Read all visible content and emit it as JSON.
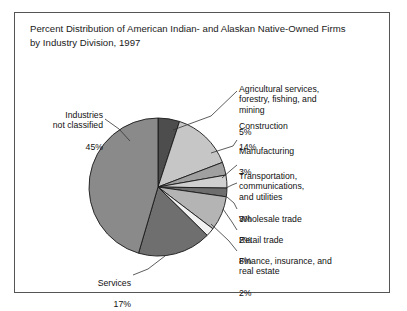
{
  "figure": {
    "title": "Percent Distribution of American Indian- and Alaskan Native-Owned Firms\nby Industry Division, 1997",
    "border_color": "#555555",
    "background_color": "#ffffff"
  },
  "chart_data": {
    "type": "pie",
    "title": "Percent Distribution of American Indian- and Alaskan Native-Owned Firms by Industry Division, 1997",
    "xlabel": "",
    "ylabel": "",
    "units": "percent",
    "start_angle_deg": 0,
    "direction": "clockwise",
    "legend": "none (direct labels with leader lines)",
    "grid": false,
    "categories": [
      "Agricultural services, forestry, fishing, and mining",
      "Construction",
      "Manufacturing",
      "Transportation, communications, and utilities",
      "Wholesale trade",
      "Retail trade",
      "Finance, insurance, and real estate",
      "Services",
      "Industries not classified"
    ],
    "values": [
      5,
      14,
      3,
      3,
      2,
      8,
      2,
      17,
      45
    ],
    "value_labels": [
      "5%",
      "14%",
      "3%",
      "3%",
      "2%",
      "8%",
      "2%",
      "17%",
      "45%"
    ],
    "colors": [
      "#4d4d4d",
      "#c6c6c6",
      "#a0a0a0",
      "#d0d0d0",
      "#6e6e6e",
      "#b4b4b4",
      "#f2f2f2",
      "#6f6f6f",
      "#8a8a8a"
    ],
    "slice_edge_color": "#1a1a1a",
    "total": 99
  },
  "labels": {
    "agricultural": {
      "name": "Agricultural services,\nforestry, fishing, and\nmining",
      "value": "5%"
    },
    "construction": {
      "name": "Construction",
      "value": "14%"
    },
    "manufacturing": {
      "name": "Manufacturing",
      "value": "3%"
    },
    "transportation": {
      "name": "Transportation,\ncommunications,\nand utilities",
      "value": "3%"
    },
    "wholesale": {
      "name": "Wholesale trade",
      "value": "2%"
    },
    "retail": {
      "name": "Retail trade",
      "value": "8%"
    },
    "finance": {
      "name": "Finance, insurance, and\nreal estate",
      "value": "2%"
    },
    "services": {
      "name": "Services",
      "value": "17%"
    },
    "unclassified": {
      "name": "Industries\nnot classified",
      "value": "45%"
    }
  }
}
